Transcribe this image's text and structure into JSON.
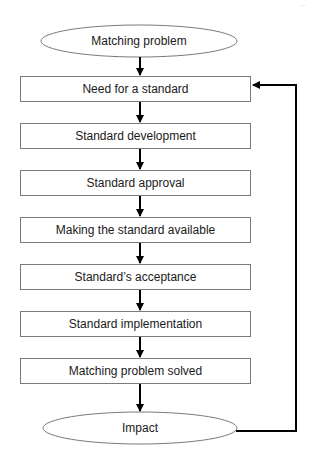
{
  "header": {
    "corner_text": "…"
  },
  "diagram": {
    "start": {
      "label": "Matching problem",
      "shape": "ellipse"
    },
    "steps": [
      {
        "label": "Need for a standard"
      },
      {
        "label": "Standard development"
      },
      {
        "label": "Standard approval"
      },
      {
        "label": "Making the standard available"
      },
      {
        "label": "Standard’s acceptance"
      },
      {
        "label": "Standard implementation"
      },
      {
        "label": "Matching problem solved"
      }
    ],
    "end": {
      "label": "Impact",
      "shape": "ellipse"
    },
    "feedback": {
      "from": "Impact",
      "to": "Need for a standard"
    },
    "colors": {
      "stroke": "#000000",
      "box_border": "#7a7a7a",
      "text": "#1a1a1a"
    }
  }
}
